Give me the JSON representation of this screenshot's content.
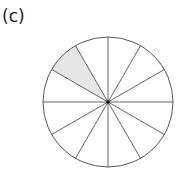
{
  "figure": {
    "label": "(c)",
    "circle": {
      "cx": 108,
      "cy": 102,
      "r": 65,
      "stroke": "#555555"
    },
    "sectors": 12,
    "shaded_sector": {
      "start_deg": 120,
      "end_deg": 150,
      "fill": "#e6e6e6"
    },
    "center_dot_color": "#111111"
  }
}
